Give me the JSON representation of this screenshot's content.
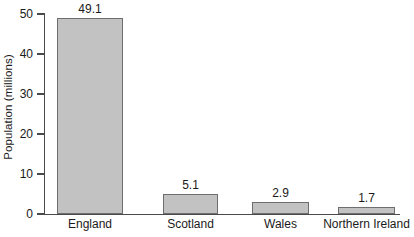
{
  "chart_data": {
    "type": "bar",
    "title": "",
    "xlabel": "",
    "ylabel": "Population (millions)",
    "categories": [
      "England",
      "Scotland",
      "Wales",
      "Northern Ireland"
    ],
    "values": [
      49.1,
      5.1,
      2.9,
      1.7
    ],
    "value_labels": [
      "49.1",
      "5.1",
      "2.9",
      "1.7"
    ],
    "ylim": [
      0,
      50
    ],
    "yticks": [
      0,
      10,
      20,
      30,
      40,
      50
    ],
    "ytick_labels": [
      "0",
      "10",
      "20",
      "30",
      "40",
      "50"
    ],
    "grid": false,
    "legend": false,
    "bar_fill_color": "#c2c2c2",
    "bar_edge_color": "#6e6e6e",
    "axis_color": "#4a4a4a",
    "background_color": "#ffffff"
  }
}
